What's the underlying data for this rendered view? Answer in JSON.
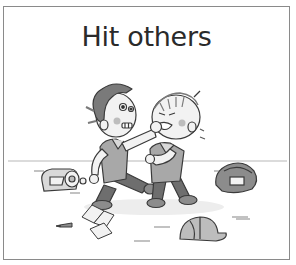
{
  "card": {
    "title": "Hit others",
    "border_color": "#8a8a8a",
    "background": "#ffffff"
  },
  "illustration": {
    "description": "Two cartoon boys fighting: left boy grabs and punches the right boy's face while kicking; scattered items on the floor",
    "figures": [
      "boy-left-attacker",
      "boy-right-victim"
    ],
    "objects": [
      "backpack-left",
      "backpack-right",
      "open-book",
      "papers",
      "pencil",
      "baseball-cap"
    ],
    "palette": {
      "line": "#3a3a3a",
      "hair": "#7a7a7a",
      "skin": "#f2f2f2",
      "shirt": "#d9d9d9",
      "vest": "#a8a8a8",
      "pants": "#6e6e6e",
      "shoes": "#8c8c8c",
      "cheek": "#bdbdbd"
    }
  }
}
